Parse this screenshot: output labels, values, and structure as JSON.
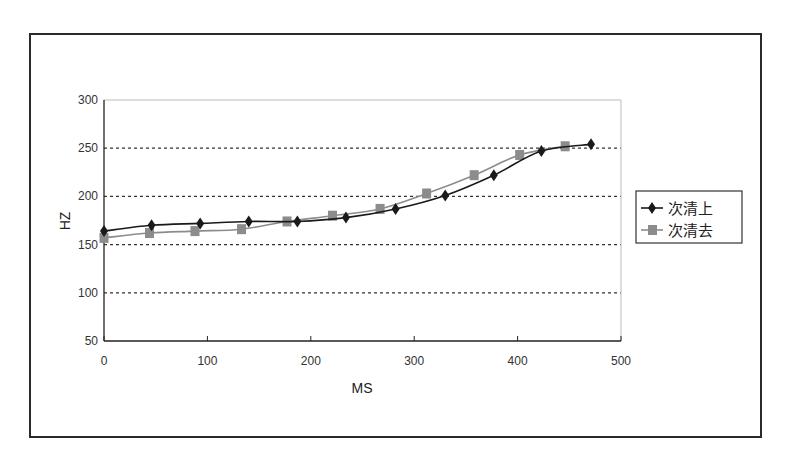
{
  "chart_data": {
    "type": "line",
    "title": "",
    "xlabel": "MS",
    "ylabel": "HZ",
    "xlim": [
      0,
      500
    ],
    "ylim": [
      50,
      300
    ],
    "xticks": [
      0,
      100,
      200,
      300,
      400,
      500
    ],
    "yticks": [
      50,
      100,
      150,
      200,
      250,
      300
    ],
    "grid": {
      "horizontal": true,
      "style": "dotted",
      "vertical": false
    },
    "legend_position": "right",
    "series": [
      {
        "name": "次清上",
        "marker": "diamond",
        "color": "#1a1a1a",
        "x": [
          0,
          46,
          93,
          140,
          187,
          234,
          282,
          330,
          377,
          423,
          471
        ],
        "y": [
          164,
          170,
          172,
          174,
          174,
          178,
          187,
          201,
          222,
          247,
          254
        ]
      },
      {
        "name": "次清去",
        "marker": "square",
        "color": "#8c8c8c",
        "x": [
          0,
          44,
          88,
          133,
          177,
          221,
          267,
          312,
          358,
          402,
          446
        ],
        "y": [
          157,
          162,
          164,
          166,
          174,
          180,
          187,
          203,
          222,
          243,
          252
        ]
      }
    ]
  }
}
